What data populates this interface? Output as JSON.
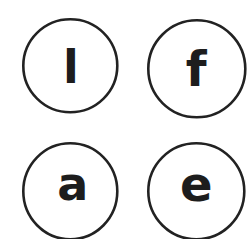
{
  "sheet": {
    "title": "Letter Circles Worksheet",
    "background_color": "#ffffff",
    "ink_color": "#222222",
    "letter_color": "#1d1d1d",
    "width": 251,
    "height": 239,
    "columns": 2,
    "rows": 2
  },
  "cards": [
    {
      "id": "card-l",
      "letter": "l",
      "letter_name": "lowercase-l",
      "position": "top-left",
      "circle": {
        "cx": 70.5,
        "cy": 66,
        "rx": 47,
        "ry": 46.5,
        "stroke_width": 2.6
      },
      "letter_style": {
        "font_size": 46,
        "x": 71,
        "y": 83
      },
      "clipped": false
    },
    {
      "id": "card-f",
      "letter": "f",
      "letter_name": "lowercase-f",
      "position": "top-right",
      "circle": {
        "cx": 196.5,
        "cy": 68.5,
        "rx": 48.5,
        "ry": 48.5,
        "stroke_width": 2.6
      },
      "letter_style": {
        "font_size": 48,
        "x": 196,
        "y": 86
      },
      "clipped": false
    },
    {
      "id": "card-a",
      "letter": "a",
      "letter_name": "lowercase-a",
      "position": "bottom-left",
      "circle": {
        "cx": 70.5,
        "cy": 191,
        "rx": 47,
        "ry": 48,
        "stroke_width": 2.6
      },
      "letter_style": {
        "font_size": 46,
        "x": 73,
        "y": 200
      },
      "clipped": true
    },
    {
      "id": "card-e",
      "letter": "e",
      "letter_name": "lowercase-e",
      "position": "bottom-right",
      "circle": {
        "cx": 196,
        "cy": 191,
        "rx": 48,
        "ry": 48,
        "stroke_width": 2.6
      },
      "letter_style": {
        "font_size": 48,
        "x": 196,
        "y": 201
      },
      "clipped": true
    }
  ]
}
